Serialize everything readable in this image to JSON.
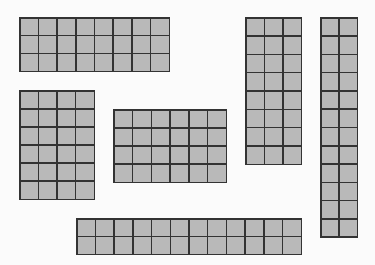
{
  "diagram": {
    "title": "",
    "colors": {
      "background": "#fbfbfb",
      "cell_fill": "#b9b9b9",
      "grid_line": "#333333"
    },
    "rectangles": [
      {
        "id": "rect-8x3",
        "columns": 8,
        "rows": 3,
        "x": 19,
        "y": 17,
        "width": 151,
        "height": 55
      },
      {
        "id": "rect-3x8",
        "columns": 3,
        "rows": 8,
        "x": 245,
        "y": 17,
        "width": 57,
        "height": 148
      },
      {
        "id": "rect-2x12",
        "columns": 2,
        "rows": 12,
        "x": 320,
        "y": 17,
        "width": 38,
        "height": 221
      },
      {
        "id": "rect-4x6",
        "columns": 4,
        "rows": 6,
        "x": 19,
        "y": 90,
        "width": 76,
        "height": 110
      },
      {
        "id": "rect-6x4",
        "columns": 6,
        "rows": 4,
        "x": 113,
        "y": 109,
        "width": 114,
        "height": 74
      },
      {
        "id": "rect-12x2",
        "columns": 12,
        "rows": 2,
        "x": 76,
        "y": 218,
        "width": 226,
        "height": 37
      }
    ]
  }
}
